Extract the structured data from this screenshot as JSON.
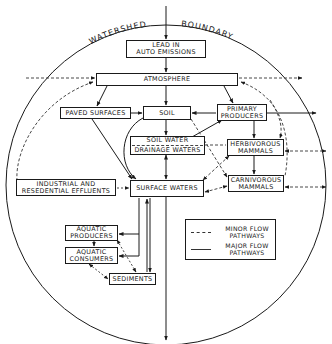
{
  "diagram": {
    "boundary_label": {
      "left": "WATERSHED",
      "right": "BOUNDARY"
    },
    "nodes": {
      "lead_emissions": {
        "lines": [
          "LEAD IN",
          "AUTO EMISSIONS"
        ]
      },
      "atmosphere": {
        "lines": [
          "ATMOSPHERE"
        ]
      },
      "paved_surfaces": {
        "lines": [
          "PAVED SURFACES"
        ]
      },
      "soil": {
        "lines": [
          "SOIL"
        ]
      },
      "primary_producers": {
        "lines": [
          "PRIMARY",
          "PRODUCERS"
        ]
      },
      "soil_water": {
        "lines": [
          "SOIL WATER",
          "DRAINAGE WATERS"
        ]
      },
      "herbivorous_mammals": {
        "lines": [
          "HERBIVOROUS",
          "MAMMALS"
        ]
      },
      "industrial_effluents": {
        "lines": [
          "INDUSTRIAL AND",
          "RESEDENTIAL EFFLUENTS"
        ]
      },
      "surface_waters": {
        "lines": [
          "SURFACE WATERS"
        ]
      },
      "carnivorous_mammals": {
        "lines": [
          "CARNIVOROUS",
          "MAMMALS"
        ]
      },
      "aquatic_producers": {
        "lines": [
          "AQUATIC",
          "PRODUCERS"
        ]
      },
      "aquatic_consumers": {
        "lines": [
          "AQUATIC",
          "CONSUMERS"
        ]
      },
      "sediments": {
        "lines": [
          "SEDIMENTS"
        ]
      }
    },
    "legend": {
      "minor": {
        "lines": [
          "MINOR FLOW",
          "PATHWAYS"
        ],
        "style": "dashed"
      },
      "major": {
        "lines": [
          "MAJOR FLOW",
          "PATHWAYS"
        ],
        "style": "solid"
      }
    },
    "edges": [
      {
        "from": "outside",
        "to": "lead_emissions",
        "type": "major"
      },
      {
        "from": "lead_emissions",
        "to": "atmosphere",
        "type": "major"
      },
      {
        "from": "outside",
        "to": "atmosphere",
        "type": "minor"
      },
      {
        "from": "atmosphere",
        "to": "outside",
        "type": "minor"
      },
      {
        "from": "atmosphere",
        "to": "paved_surfaces",
        "type": "major"
      },
      {
        "from": "atmosphere",
        "to": "soil",
        "type": "major"
      },
      {
        "from": "atmosphere",
        "to": "primary_producers",
        "type": "major"
      },
      {
        "from": "paved_surfaces",
        "to": "soil",
        "type": "major"
      },
      {
        "from": "primary_producers",
        "to": "soil",
        "type": "major"
      },
      {
        "from": "primary_producers",
        "to": "outside",
        "type": "major"
      },
      {
        "from": "soil",
        "to": "soil_water",
        "type": "major"
      },
      {
        "from": "soil",
        "to": "surface_waters",
        "type": "major"
      },
      {
        "from": "soil_water",
        "to": "primary_producers",
        "type": "major"
      },
      {
        "from": "soil_water",
        "to": "surface_waters",
        "type": "major"
      },
      {
        "from": "paved_surfaces",
        "to": "surface_waters",
        "type": "major"
      },
      {
        "from": "primary_producers",
        "to": "herbivorous_mammals",
        "type": "major"
      },
      {
        "from": "herbivorous_mammals",
        "to": "carnivorous_mammals",
        "type": "major"
      },
      {
        "from": "industrial_effluents",
        "to": "surface_waters",
        "type": "minor"
      },
      {
        "from": "surface_waters",
        "to": "aquatic_producers",
        "type": "major"
      },
      {
        "from": "surface_waters",
        "to": "aquatic_consumers",
        "type": "major"
      },
      {
        "from": "surface_waters",
        "to": "sediments",
        "type": "major"
      },
      {
        "from": "aquatic_producers",
        "to": "aquatic_consumers",
        "type": "major"
      },
      {
        "from": "aquatic_producers",
        "to": "sediments",
        "type": "minor"
      },
      {
        "from": "aquatic_consumers",
        "to": "sediments",
        "type": "minor"
      },
      {
        "from": "surface_waters",
        "to": "outside",
        "type": "major"
      },
      {
        "from": "herbivorous_mammals",
        "to": "outside",
        "type": "minor"
      },
      {
        "from": "carnivorous_mammals",
        "to": "outside",
        "type": "minor"
      },
      {
        "from": "herbivorous_mammals",
        "to": "surface_waters",
        "type": "minor"
      },
      {
        "from": "carnivorous_mammals",
        "to": "surface_waters",
        "type": "minor"
      },
      {
        "from": "soil",
        "to": "carnivorous_mammals",
        "type": "minor"
      },
      {
        "from": "soil_water",
        "to": "herbivorous_mammals",
        "type": "minor"
      }
    ]
  }
}
